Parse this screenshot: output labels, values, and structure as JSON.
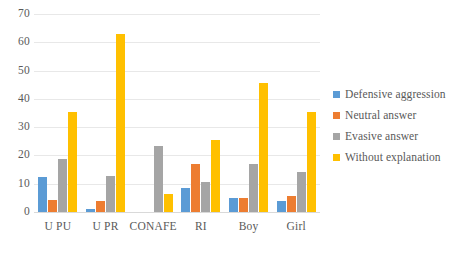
{
  "chart_data": {
    "type": "bar",
    "title": "",
    "subtitle": "",
    "xlabel": "",
    "ylabel": "",
    "ylim": [
      0,
      70
    ],
    "ytick_step": 10,
    "yticks": [
      70,
      60,
      50,
      40,
      30,
      20,
      10,
      0
    ],
    "grid": true,
    "legend_position": "right",
    "categories": [
      "U PU",
      "U PR",
      "CONAFE",
      "RI",
      "Boy",
      "Girl"
    ],
    "series": [
      {
        "name": "Defensive aggression",
        "color": "#5B9BD5",
        "values": [
          12.3,
          1.0,
          0,
          8.5,
          5.0,
          4.0
        ]
      },
      {
        "name": "Neutral answer",
        "color": "#ED7D31",
        "values": [
          4.2,
          4.0,
          0,
          17.0,
          5.0,
          5.8
        ]
      },
      {
        "name": "Evasive answer",
        "color": "#A5A5A5",
        "values": [
          18.6,
          12.8,
          23.3,
          10.6,
          16.8,
          14.0
        ]
      },
      {
        "name": "Without explanation",
        "color": "#FFC000",
        "values": [
          35.2,
          62.9,
          6.5,
          25.5,
          45.5,
          35.2
        ]
      }
    ]
  },
  "legend": {
    "items": [
      {
        "label": "Defensive aggression",
        "color": "#5B9BD5"
      },
      {
        "label": "Neutral answer",
        "color": "#ED7D31"
      },
      {
        "label": "Evasive answer",
        "color": "#A5A5A5"
      },
      {
        "label": "Without explanation",
        "color": "#FFC000"
      }
    ]
  }
}
